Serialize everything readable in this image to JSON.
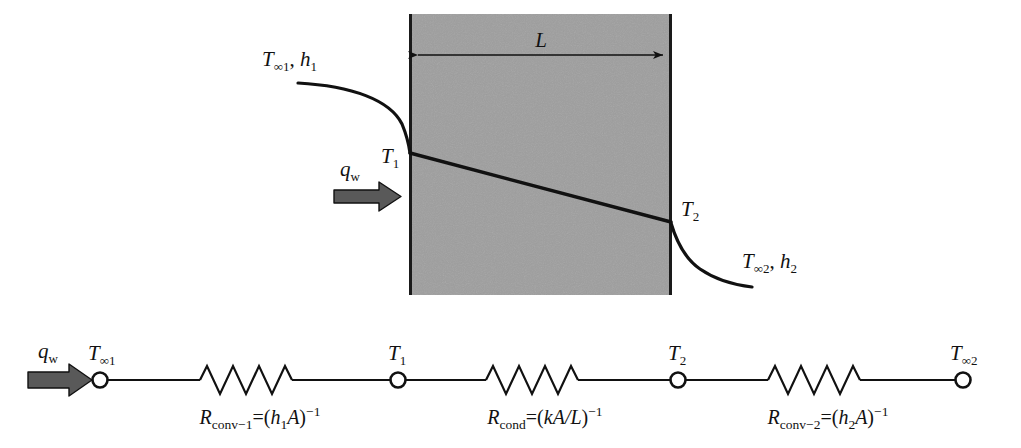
{
  "figure": {
    "type": "thermal-resistance-diagram",
    "title_visible": false,
    "colors": {
      "wall_fill": "#9e9e9e",
      "wall_stroke": "#1a1a1a",
      "line": "#111111",
      "arrow_fill": "#595959",
      "arrow_stroke": "#111111",
      "node_fill": "#ffffff",
      "background": "#ffffff"
    }
  },
  "wall_diagram": {
    "inlet_label": {
      "T": "T",
      "T_sub": "∞1",
      "comma": ", ",
      "h": "h",
      "h_sub": "1"
    },
    "outlet_label": {
      "T": "T",
      "T_sub": "∞2",
      "comma": ", ",
      "h": "h",
      "h_sub": "2"
    },
    "heat_flux_label": {
      "q": "q",
      "q_sub": "w"
    },
    "thickness_label": "L",
    "surface_temp_1": {
      "T": "T",
      "sub": "1"
    },
    "surface_temp_2": {
      "T": "T",
      "sub": "2"
    },
    "wall": {
      "x": 409,
      "y": 14,
      "width": 263,
      "height": 281
    },
    "temperature_profile": {
      "wall_left_y": 153,
      "wall_right_y": 222,
      "inlet_curve_start_x": 298,
      "outlet_curve_end_x": 640
    }
  },
  "resistance_network": {
    "heat_flux_label": {
      "q": "q",
      "q_sub": "w"
    },
    "nodes": [
      {
        "name": "T-inf-1",
        "T": "T",
        "sub": "∞1",
        "x": 100
      },
      {
        "name": "T-1",
        "T": "T",
        "sub": "1",
        "x": 398
      },
      {
        "name": "T-2",
        "T": "T",
        "sub": "2",
        "x": 678
      },
      {
        "name": "T-inf-2",
        "T": "T",
        "sub": "∞2",
        "x": 963
      }
    ],
    "resistors": [
      {
        "name": "R-conv-1",
        "R": "R",
        "R_sub": "conv−1",
        "equals": "=",
        "expr_open": "(",
        "expr_var": "h",
        "expr_var_sub": "1",
        "expr_area": "A",
        "expr_close": ")",
        "exponent": "−1",
        "center_x": 252,
        "label_center_x": 260
      },
      {
        "name": "R-cond",
        "R": "R",
        "R_sub": "cond",
        "equals": "=",
        "expr_open": "(",
        "expr_var": "k",
        "expr_var_sub": "",
        "expr_area": "A/L",
        "expr_close": ")",
        "exponent": "−1",
        "center_x": 538,
        "label_center_x": 545
      },
      {
        "name": "R-conv-2",
        "R": "R",
        "R_sub": "conv−2",
        "equals": "=",
        "expr_open": "(",
        "expr_var": "h",
        "expr_var_sub": "2",
        "expr_area": "A",
        "expr_close": ")",
        "exponent": "−1",
        "center_x": 820,
        "label_center_x": 828
      }
    ],
    "baseline_y": 380
  }
}
